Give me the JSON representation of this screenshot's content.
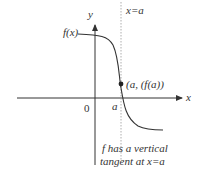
{
  "diagram": {
    "axis_x_label": "x",
    "axis_y_label": "y",
    "origin_label": "0",
    "function_label": "f(x)",
    "vertical_line_label": "x=a",
    "point_label": "(a, (f(a))",
    "a_label": "a",
    "caption_line1": "f has a vertical",
    "caption_line2": "tangent at x=a",
    "colors": {
      "line": "#333333",
      "dotted": "#999999"
    }
  }
}
